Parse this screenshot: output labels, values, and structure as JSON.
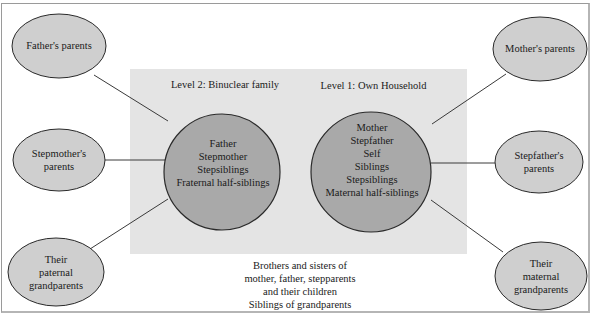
{
  "diagram": {
    "levels": {
      "level2": {
        "title": "Level 2: Binuclear family",
        "members": [
          "Father",
          "Stepmother",
          "Stepsiblings",
          "Fraternal half-siblings"
        ]
      },
      "level1": {
        "title": "Level 1: Own Household",
        "members": [
          "Mother",
          "Stepfather",
          "Self",
          "Siblings",
          "Stepsiblings",
          "Maternal half-siblings"
        ]
      }
    },
    "outer_nodes": {
      "fathers_parents": [
        "Father's parents"
      ],
      "stepmothers_parents": [
        "Stepmother's",
        "parents"
      ],
      "paternal_grandparents": [
        "Their",
        "paternal",
        "grandparents"
      ],
      "mothers_parents": [
        "Mother's parents"
      ],
      "stepfathers_parents": [
        "Stepfather's",
        "parents"
      ],
      "maternal_grandparents": [
        "Their",
        "maternal",
        "grandparents"
      ]
    },
    "extended_note": [
      "Brothers and sisters of",
      "mother, father, stepparents",
      "and their children",
      "Siblings of grandparents"
    ],
    "colors": {
      "panel": "#e4e4e4",
      "circle": "#a9a9a9",
      "oval": "#cfcfcf",
      "stroke": "#3a3a3a"
    }
  }
}
